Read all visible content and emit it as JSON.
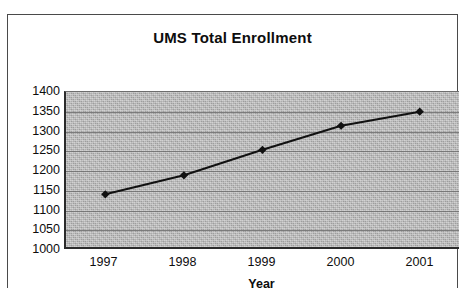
{
  "chart_data": {
    "type": "line",
    "title": "UMS Total Enrollment",
    "xlabel": "Year",
    "ylabel": "",
    "categories": [
      "1997",
      "1998",
      "1999",
      "2000",
      "2001"
    ],
    "values": [
      1136,
      1185,
      1251,
      1313,
      1349
    ],
    "series": [
      {
        "name": "UMS Total Enrollment",
        "values": [
          1136,
          1185,
          1251,
          1313,
          1349
        ]
      }
    ],
    "ylim": [
      1000,
      1400
    ],
    "yticks": [
      1400,
      1350,
      1300,
      1250,
      1200,
      1150,
      1100,
      1050,
      1000
    ],
    "ytick_labels": [
      "1400",
      "1350",
      "1300",
      "1250",
      "1200",
      "1150",
      "1100",
      "1050",
      "1000"
    ],
    "grid": true,
    "legend": false,
    "legend_position": "none",
    "marker": "diamond",
    "line_color": "#111111",
    "marker_color": "#111111",
    "plot_background": "#a9a9a9",
    "gridline_color": "#6f6f6f",
    "page_background": "#ffffff",
    "border_color": "#4a4a4a"
  }
}
